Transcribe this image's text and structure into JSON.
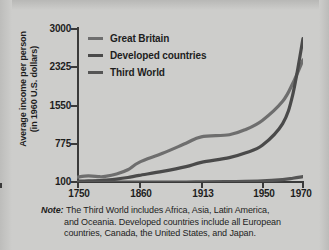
{
  "chart_data": {
    "type": "line",
    "title": "",
    "subtitle": "",
    "xlabel": "",
    "ylabel": "Average income per person (in 1960 U.S. dollars)",
    "ylabel_line1": "Average income per person",
    "ylabel_line2": "(in 1960 U.S. dollars)",
    "x_tick_labels": [
      "1750",
      "1860",
      "1913",
      "1950",
      "1970"
    ],
    "x_tick_values": [
      1750,
      1860,
      1913,
      1950,
      1970
    ],
    "x_tick_positions_pct": [
      0,
      27.5,
      55,
      82,
      100
    ],
    "y_tick_labels": [
      "100",
      "775",
      "1550",
      "2325",
      "3000"
    ],
    "y_tick_values": [
      100,
      775,
      1550,
      2325,
      3000
    ],
    "ylim": [
      100,
      3000
    ],
    "grid": false,
    "legend_position": "top-left",
    "series": [
      {
        "name": "Great Britain",
        "color": "#6e6e6e",
        "x": [
          1750,
          1770,
          1790,
          1800,
          1820,
          1840,
          1860,
          1880,
          1900,
          1913,
          1930,
          1940,
          1950,
          1960,
          1965,
          1970
        ],
        "values": [
          190,
          215,
          200,
          205,
          250,
          330,
          470,
          640,
          830,
          950,
          990,
          1090,
          1260,
          1620,
          1960,
          2400
        ]
      },
      {
        "name": "Developed countries",
        "color": "#4a4a4a",
        "x": [
          1750,
          1770,
          1790,
          1800,
          1820,
          1840,
          1860,
          1880,
          1900,
          1913,
          1930,
          1940,
          1950,
          1960,
          1965,
          1970
        ],
        "values": [
          115,
          120,
          128,
          135,
          155,
          185,
          225,
          300,
          390,
          470,
          560,
          650,
          790,
          1200,
          1750,
          2800
        ]
      },
      {
        "name": "Third World",
        "color": "#555555",
        "x": [
          1750,
          1800,
          1860,
          1900,
          1913,
          1930,
          1950,
          1960,
          1965,
          1970
        ],
        "values": [
          100,
          100,
          98,
          100,
          102,
          108,
          120,
          145,
          170,
          200
        ]
      }
    ],
    "note": {
      "label": "Note:",
      "text": "The Third World includes Africa, Asia, Latin America, and Oceania. Developed countries include all European countries, Canada, the United States, and Japan.",
      "lines": [
        "The Third World includes Africa, Asia, Latin America,",
        "and Oceania. Developed countries include all European",
        "countries, Canada, the United States, and Japan."
      ]
    },
    "colors": {
      "background": "#cdcdcb",
      "axis": "#3a3a3a",
      "text": "#1d1d1d",
      "great_britain": "#6e6e6e",
      "developed_countries": "#4a4a4a",
      "third_world": "#555555"
    }
  }
}
